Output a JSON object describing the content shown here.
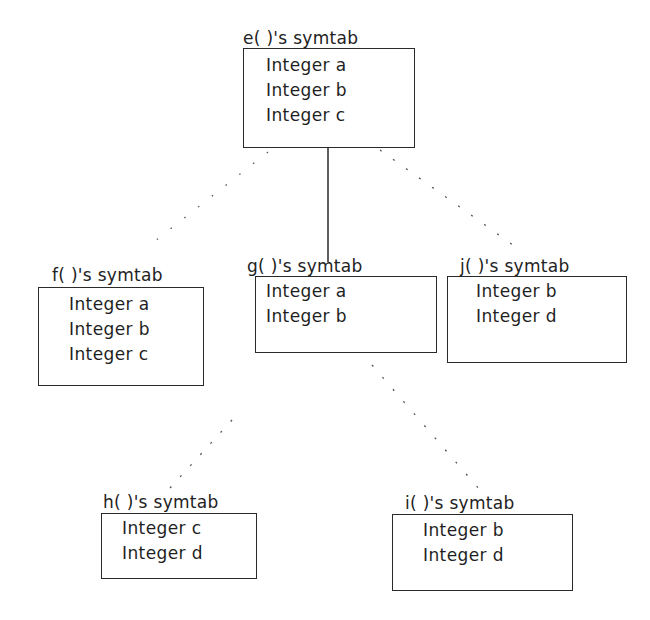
{
  "diagram": {
    "type": "symbol-table-tree",
    "nodes": [
      {
        "id": "e",
        "title": "e( )'s symtab",
        "fields": [
          "Integer a",
          "Integer b",
          "Integer c"
        ]
      },
      {
        "id": "f",
        "title": "f( )'s symtab",
        "fields": [
          "Integer a",
          "Integer b",
          "Integer c"
        ]
      },
      {
        "id": "g",
        "title": "g( )'s symtab",
        "fields": [
          "Integer a",
          "Integer b"
        ]
      },
      {
        "id": "j",
        "title": "j( )'s symtab",
        "fields": [
          "Integer b",
          "Integer d"
        ]
      },
      {
        "id": "h",
        "title": "h( )'s symtab",
        "fields": [
          "Integer c",
          "Integer d"
        ]
      },
      {
        "id": "i",
        "title": "i( )'s symtab",
        "fields": [
          "Integer b",
          "Integer d"
        ]
      }
    ],
    "edges": [
      {
        "from": "e",
        "to": "f",
        "style": "dotted"
      },
      {
        "from": "e",
        "to": "g",
        "style": "solid"
      },
      {
        "from": "e",
        "to": "j",
        "style": "dotted"
      },
      {
        "from": "g",
        "to": "h",
        "style": "dotted"
      },
      {
        "from": "g",
        "to": "i",
        "style": "dotted"
      }
    ],
    "colors": {
      "line": "#2a2a2a",
      "background": "#ffffff"
    }
  }
}
